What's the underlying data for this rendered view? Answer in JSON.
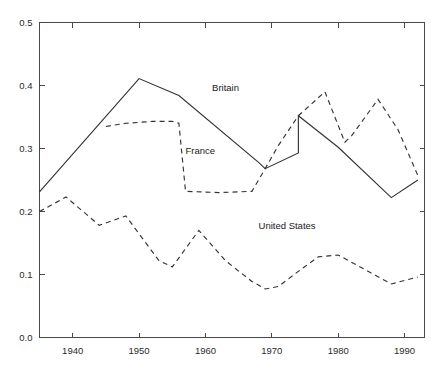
{
  "chart_data": {
    "type": "line",
    "title": "",
    "subtitle": "",
    "xlabel": "",
    "ylabel": "",
    "xlim": [
      1935,
      1993
    ],
    "ylim": [
      0.0,
      0.5
    ],
    "grid": false,
    "legend_position": "inline-annotations",
    "xticks": [
      1940,
      1950,
      1960,
      1970,
      1980,
      1990
    ],
    "xtick_labels": [
      "1940",
      "1950",
      "1960",
      "1970",
      "1980",
      "1990"
    ],
    "yticks": [
      0.0,
      0.1,
      0.2,
      0.3,
      0.4,
      0.5
    ],
    "ytick_labels": [
      "0.0",
      "0.1",
      "0.2",
      "0.3",
      "0.4",
      "0.5"
    ],
    "series": [
      {
        "name": "Britain",
        "style": "solid",
        "color": "#333333",
        "label_x": 1961,
        "label_y": 0.392,
        "x": [
          1935,
          1950,
          1956,
          1968,
          1969,
          1974,
          1974,
          1980,
          1988,
          1992
        ],
        "y": [
          0.231,
          0.411,
          0.384,
          0.278,
          0.268,
          0.293,
          0.352,
          0.302,
          0.222,
          0.25
        ]
      },
      {
        "name": "France",
        "style": "dashed",
        "color": "#333333",
        "label_x": 1957,
        "label_y": 0.291,
        "x": [
          1945,
          1948,
          1952,
          1955,
          1956,
          1957,
          1962,
          1967,
          1969,
          1971,
          1974,
          1978,
          1981,
          1982,
          1986,
          1989,
          1992
        ],
        "y": [
          0.335,
          0.34,
          0.343,
          0.343,
          0.34,
          0.232,
          0.23,
          0.232,
          0.268,
          0.305,
          0.352,
          0.39,
          0.31,
          0.32,
          0.378,
          0.33,
          0.257
        ]
      },
      {
        "name": "United States",
        "style": "dashed",
        "color": "#333333",
        "label_x": 1968,
        "label_y": 0.173,
        "x": [
          1935,
          1939,
          1944,
          1948,
          1953,
          1955,
          1959,
          1963,
          1967,
          1969,
          1971,
          1974,
          1977,
          1980,
          1984,
          1988,
          1992
        ],
        "y": [
          0.2,
          0.223,
          0.178,
          0.193,
          0.122,
          0.112,
          0.17,
          0.122,
          0.089,
          0.077,
          0.081,
          0.105,
          0.128,
          0.131,
          0.108,
          0.085,
          0.096
        ]
      }
    ]
  },
  "figure": {
    "background_color": "#ffffff",
    "axis_color": "#4a4a4a",
    "text_color": "#2b2b2b"
  }
}
